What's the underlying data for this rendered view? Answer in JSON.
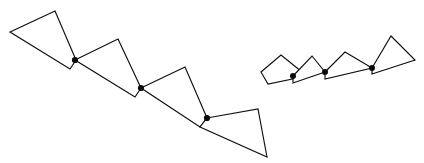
{
  "figure": {
    "background_color": "#ffffff",
    "stroke_color": "#0f0f12",
    "joint_color": "#0b0b0e",
    "fill_color": "#ffffff",
    "stroke_width": 1.15,
    "joint_radius": 3.1,
    "canvas": {
      "width": 424,
      "height": 163
    },
    "chains": [
      {
        "name": "large-chain",
        "direction": "descending",
        "polygon_count": 4,
        "polygons": [
          {
            "name": "large-quad-1",
            "points": "10,32 55,11 76,60 70,69"
          },
          {
            "name": "large-quad-2",
            "points": "75,60 118,39 141,88 135,97"
          },
          {
            "name": "large-quad-3",
            "points": "141,88 185,67 207,118 200,127"
          },
          {
            "name": "large-quad-4",
            "points": "207,118 258,109 267,157 200,127"
          }
        ],
        "joints": [
          {
            "name": "large-joint-1",
            "cx": 75,
            "cy": 60
          },
          {
            "name": "large-joint-2",
            "cx": 141,
            "cy": 88
          },
          {
            "name": "large-joint-3",
            "cx": 207,
            "cy": 118
          }
        ]
      },
      {
        "name": "small-chain",
        "direction": "ascending",
        "polygon_count": 4,
        "polygons": [
          {
            "name": "small-quad-1",
            "points": "261,72 281,55 307,76 268,84"
          },
          {
            "name": "small-quad-2",
            "points": "293,76 312,56 325,72 293,83"
          },
          {
            "name": "small-quad-3",
            "points": "325,72 345,52 372,68 325,79"
          },
          {
            "name": "small-quad-4",
            "points": "372,68 391,36 415,60 372,74"
          }
        ],
        "joints": [
          {
            "name": "small-joint-1",
            "cx": 293,
            "cy": 76
          },
          {
            "name": "small-joint-2",
            "cx": 325,
            "cy": 72
          },
          {
            "name": "small-joint-3",
            "cx": 372,
            "cy": 68
          }
        ]
      }
    ]
  }
}
